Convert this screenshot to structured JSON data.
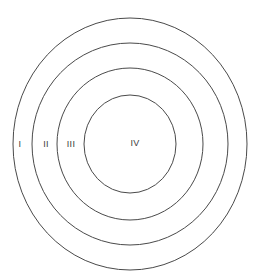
{
  "canvas": {
    "width": 261,
    "height": 276,
    "background_color": "#ffffff"
  },
  "style": {
    "stroke_color": "#4a4a4a",
    "stroke_width": 1,
    "label_color": "#3c3c3c",
    "label_font_size": 9
  },
  "chart_data": {
    "type": "diagram",
    "subtype": "concentric-circles",
    "title": "",
    "center": {
      "x": 130,
      "y": 144
    },
    "rings": [
      {
        "label": "I",
        "rx": 117,
        "ry": 126,
        "label_x": 20,
        "label_y": 145,
        "fill": "none"
      },
      {
        "label": "II",
        "rx": 98,
        "ry": 101,
        "label_x": 46,
        "label_y": 145,
        "fill": "none"
      },
      {
        "label": "III",
        "rx": 73,
        "ry": 76,
        "label_x": 71,
        "label_y": 145,
        "fill": "none"
      },
      {
        "label": "IV",
        "rx": 46,
        "ry": 49,
        "label_x": 135,
        "label_y": 144,
        "fill": "none"
      }
    ],
    "labels": [
      "I",
      "II",
      "III",
      "IV"
    ],
    "legend": null,
    "xlabel": "",
    "ylabel": ""
  }
}
